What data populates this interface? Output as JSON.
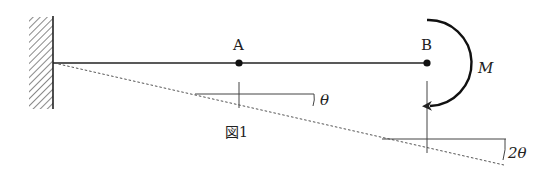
{
  "figure": {
    "caption": "図1",
    "points": [
      {
        "label": "A"
      },
      {
        "label": "B"
      }
    ],
    "moment": {
      "label": "M"
    },
    "angles": [
      {
        "label": "θ",
        "at": "A"
      },
      {
        "label": "2θ",
        "at": "B"
      }
    ],
    "support": "fixed wall (left)",
    "colors": {
      "line": "#222222",
      "dash": "#555555",
      "hatch": "#555555"
    }
  }
}
